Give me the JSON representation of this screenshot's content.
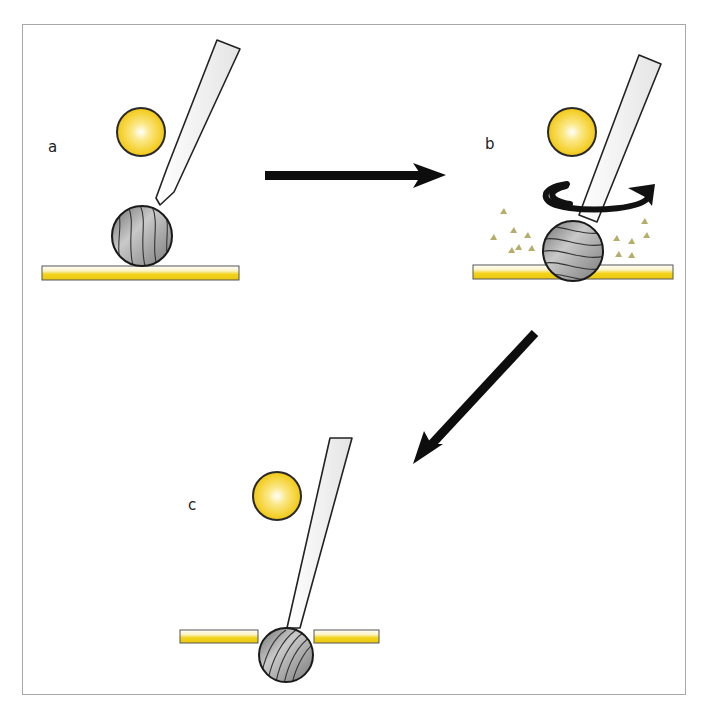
{
  "diagram": {
    "panels": [
      {
        "id": "a",
        "label": "a",
        "description": "Probe with ball tip resting on coated substrate; light source (yellow sphere) nearby"
      },
      {
        "id": "b",
        "label": "b",
        "description": "Probe rotating; ball abrades coating, debris particles released"
      },
      {
        "id": "c",
        "label": "c",
        "description": "Ball penetrated through coating layer; coating split on either side"
      }
    ],
    "arrows": [
      {
        "from": "a",
        "to": "b",
        "direction": "right"
      },
      {
        "from": "b",
        "to": "c",
        "direction": "down-left"
      }
    ],
    "colors": {
      "coating_yellow": "#f2d21b",
      "light_yellow": "#f5cf1a",
      "ball_gray": "#9a9a9a",
      "outline": "#1a1a1a",
      "debris": "#b9b070",
      "frame": "#a8a8a8"
    }
  }
}
